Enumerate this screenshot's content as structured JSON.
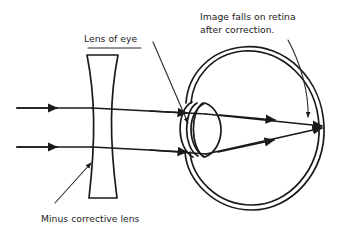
{
  "figure": {
    "background_color": "#ffffff",
    "ink_color": "#1a1a1a",
    "width": 345,
    "height": 231
  },
  "labels": {
    "lens_of_eye": "Lens of eye",
    "image_on_retina_line1": "Image falls on retina",
    "image_on_retina_line2": "after correction.",
    "minus_corrective_lens": "Minus corrective lens"
  },
  "parts": {
    "corrective_lens": {
      "name": "Minus corrective lens",
      "shape": "biconcave",
      "top_y": 55,
      "bottom_y": 198,
      "center_x": 103
    },
    "eyeball": {
      "name": "Eyeball",
      "shape": "double-outlined oval",
      "center_x": 255,
      "center_y": 128,
      "radius_x": 70,
      "radius_y": 81
    },
    "crystalline_lens": {
      "name": "Lens of eye",
      "shape": "vertical ellipse",
      "center_x": 205,
      "center_y": 129
    },
    "cornea": {
      "name": "Cornea",
      "shape": "arc bulge at front of eye"
    },
    "retina": {
      "name": "Retina",
      "focus_point_x": 322,
      "focus_point_y": 126
    }
  },
  "rays": {
    "count": 2,
    "description": "Two parallel horizontal rays enter from the left, diverge slightly through the minus lens, then converge through the eye lens to a point on the retina.",
    "incoming_start_x": 17,
    "incoming_top_y": 108,
    "incoming_bottom_y": 147,
    "converge_x": 322,
    "converge_y": 126,
    "arrow_markers": 6
  },
  "leaders": [
    {
      "for": "Lens of eye",
      "from_x": 153,
      "from_y": 48,
      "to_x": 188,
      "to_y": 124,
      "has_arrowhead": true
    },
    {
      "for": "Image falls on retina after correction.",
      "from_x": 288,
      "from_y": 45,
      "to_x": 307,
      "to_y": 118,
      "has_arrowhead": true
    },
    {
      "for": "Minus corrective lens",
      "from_x": 55,
      "from_y": 196,
      "to_x": 92,
      "to_y": 162,
      "has_arrowhead": true
    }
  ]
}
